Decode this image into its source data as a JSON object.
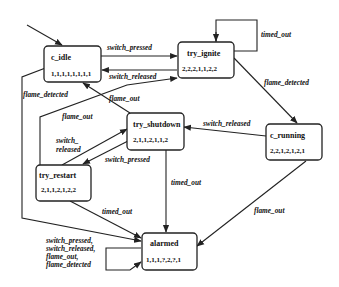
{
  "diagram": {
    "type": "state-machine",
    "states": [
      {
        "id": "c_idle",
        "name": "c_idle",
        "values": "1,1,1,1,1,1,1,1",
        "initial": true
      },
      {
        "id": "try_ignite",
        "name": "try_ignite",
        "values": "2,2,2,1,1,2,2"
      },
      {
        "id": "try_shutdown",
        "name": "try_shutdown",
        "values": "2,1,1,2,1,1,2"
      },
      {
        "id": "c_running",
        "name": "c_running",
        "values": "2,2,1,2,1,2,1"
      },
      {
        "id": "try_restart",
        "name": "try_restart",
        "values": "2,1,1,2,1,2,2"
      },
      {
        "id": "alarmed",
        "name": "alarmed",
        "values": "1,1,1,?,2,?,1"
      }
    ],
    "transitions": [
      {
        "from": "c_idle",
        "to": "try_ignite",
        "label": "switch_pressed"
      },
      {
        "from": "try_ignite",
        "to": "c_idle",
        "label": "switch_released"
      },
      {
        "from": "try_ignite",
        "to": "try_ignite",
        "label": "timed_out"
      },
      {
        "from": "try_ignite",
        "to": "c_running",
        "label": "flame_detected"
      },
      {
        "from": "c_running",
        "to": "try_shutdown",
        "label": "switch_released"
      },
      {
        "from": "c_running",
        "to": "alarmed",
        "label": "flame_out"
      },
      {
        "from": "try_shutdown",
        "to": "c_idle",
        "label": "flame_out"
      },
      {
        "from": "try_shutdown",
        "to": "try_restart",
        "label": "switch_pressed"
      },
      {
        "from": "try_shutdown",
        "to": "alarmed",
        "label": "timed_out"
      },
      {
        "from": "try_restart",
        "to": "try_shutdown",
        "label": "switch_\nreleased"
      },
      {
        "from": "try_restart",
        "to": "try_ignite",
        "label": "flame_out"
      },
      {
        "from": "try_restart",
        "to": "alarmed",
        "label": "timed_out"
      },
      {
        "from": "c_idle",
        "to": "alarmed",
        "label": "flame_detected"
      },
      {
        "from": "alarmed",
        "to": "alarmed",
        "label": "switch_pressed,\nswitch_released,\nflame_out,\nflame_detected"
      }
    ],
    "labels": {
      "idle_to_ignite": "switch_pressed",
      "ignite_to_idle": "switch_released",
      "ignite_self": "timed_out",
      "ignite_to_running": "flame_detected",
      "running_to_shutdown": "switch_released",
      "running_to_alarmed": "flame_out",
      "shutdown_to_idle": "flame_out",
      "restart_to_ignite": "flame_out",
      "idle_to_alarmed": "flame_detected",
      "restart_to_shutdown_1": "switch_",
      "restart_to_shutdown_2": "released",
      "shutdown_to_restart": "switch_pressed",
      "shutdown_to_alarmed": "timed_out",
      "restart_to_alarmed": "timed_out",
      "alarmed_self_1": "switch_pressed,",
      "alarmed_self_2": "switch_released,",
      "alarmed_self_3": "flame_out,",
      "alarmed_self_4": "flame_detected"
    }
  }
}
